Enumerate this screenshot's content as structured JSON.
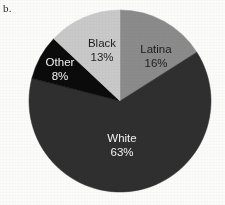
{
  "figure": {
    "panel_label": "b.",
    "background_color": "#fbfbfa"
  },
  "chart_data": {
    "type": "pie",
    "title": "",
    "subtitle": "",
    "xlabel": "",
    "ylabel": "",
    "legend_position": "none",
    "grid": false,
    "value_unit": "%",
    "start_angle_deg": 0,
    "direction": "clockwise",
    "center": {
      "x": 120,
      "y": 101
    },
    "radius": 91,
    "categories": [
      "Latina",
      "White",
      "Other",
      "Black"
    ],
    "values": [
      16,
      63,
      8,
      13
    ],
    "slices": [
      {
        "label": "Latina",
        "value": 16,
        "value_text": "16%",
        "color": "#8b8b8b",
        "text_color": "#1d1d1d",
        "label_x": 156,
        "label_y": 50
      },
      {
        "label": "White",
        "value": 63,
        "value_text": "63%",
        "color": "#2f2f2f",
        "text_color": "#f2f2f2",
        "label_x": 122,
        "label_y": 139
      },
      {
        "label": "Other",
        "value": 8,
        "value_text": "8%",
        "color": "#0b0b0b",
        "text_color": "#f4f4f4",
        "label_x": 60,
        "label_y": 63
      },
      {
        "label": "Black",
        "value": 13,
        "value_text": "13%",
        "color": "#c9c9c9",
        "text_color": "#1d1d1d",
        "label_x": 102,
        "label_y": 44
      }
    ]
  }
}
